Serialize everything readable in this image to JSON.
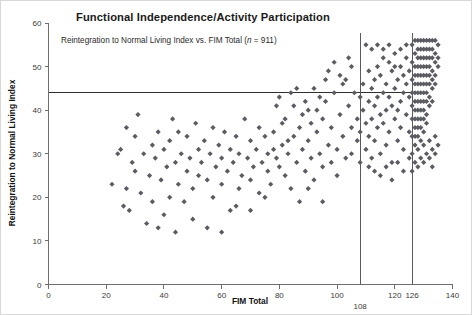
{
  "chart_data": {
    "type": "scatter",
    "title": "Functional Independence/Activity Participation",
    "subtitle_prefix": "Reintegration to Normal Living Index vs. FIM Total (",
    "subtitle_italic": "n",
    "subtitle_suffix": " = 911)",
    "xlabel": "FIM Total",
    "ylabel": "Reintegration to Normal Living Index",
    "xlim": [
      0,
      140
    ],
    "ylim": [
      0,
      60
    ],
    "xticks": [
      0,
      20,
      40,
      60,
      80,
      100,
      120,
      140
    ],
    "yticks": [
      0,
      10,
      20,
      30,
      40,
      50,
      60
    ],
    "grid": false,
    "legend": "none",
    "n": 911,
    "marker": "diamond",
    "marker_color": "#5b5b62",
    "marker_size": 4,
    "reference_lines": {
      "horizontal": [
        {
          "value": 44,
          "label": "",
          "axis": "y",
          "color": "#2e2e2e"
        }
      ],
      "vertical": [
        {
          "value": 108,
          "label": "108",
          "axis": "x",
          "color": "#5a5a5a"
        },
        {
          "value": 126,
          "label": "126",
          "axis": "x",
          "color": "#5a5a5a"
        }
      ]
    },
    "points": [
      [
        22,
        23
      ],
      [
        24,
        30
      ],
      [
        25,
        31
      ],
      [
        26,
        18
      ],
      [
        27,
        36
      ],
      [
        27,
        22
      ],
      [
        28,
        17
      ],
      [
        29,
        28
      ],
      [
        30,
        34
      ],
      [
        30,
        26
      ],
      [
        31,
        39
      ],
      [
        32,
        21
      ],
      [
        33,
        30
      ],
      [
        34,
        14
      ],
      [
        35,
        25
      ],
      [
        36,
        32
      ],
      [
        36,
        19
      ],
      [
        37,
        29
      ],
      [
        38,
        35
      ],
      [
        39,
        24
      ],
      [
        40,
        31
      ],
      [
        40,
        16
      ],
      [
        41,
        27
      ],
      [
        42,
        33
      ],
      [
        42,
        20
      ],
      [
        43,
        38
      ],
      [
        44,
        28
      ],
      [
        45,
        23
      ],
      [
        45,
        35
      ],
      [
        46,
        30
      ],
      [
        47,
        19
      ],
      [
        48,
        26
      ],
      [
        48,
        34
      ],
      [
        49,
        29
      ],
      [
        50,
        22
      ],
      [
        51,
        37
      ],
      [
        52,
        31
      ],
      [
        52,
        25
      ],
      [
        53,
        28
      ],
      [
        54,
        33
      ],
      [
        55,
        13
      ],
      [
        55,
        24
      ],
      [
        56,
        30
      ],
      [
        57,
        36
      ],
      [
        57,
        20
      ],
      [
        58,
        27
      ],
      [
        59,
        32
      ],
      [
        60,
        23
      ],
      [
        60,
        29
      ],
      [
        61,
        35
      ],
      [
        62,
        26
      ],
      [
        63,
        31
      ],
      [
        63,
        17
      ],
      [
        64,
        28
      ],
      [
        65,
        34
      ],
      [
        66,
        22
      ],
      [
        66,
        30
      ],
      [
        67,
        25
      ],
      [
        68,
        38
      ],
      [
        69,
        29
      ],
      [
        70,
        24
      ],
      [
        70,
        33
      ],
      [
        71,
        27
      ],
      [
        72,
        31
      ],
      [
        73,
        21
      ],
      [
        73,
        36
      ],
      [
        74,
        28
      ],
      [
        75,
        34
      ],
      [
        76,
        26
      ],
      [
        76,
        30
      ],
      [
        77,
        23
      ],
      [
        78,
        35
      ],
      [
        79,
        29
      ],
      [
        79,
        41
      ],
      [
        80,
        27
      ],
      [
        81,
        32
      ],
      [
        82,
        25
      ],
      [
        82,
        38
      ],
      [
        83,
        30
      ],
      [
        84,
        44
      ],
      [
        84,
        22
      ],
      [
        85,
        34
      ],
      [
        86,
        28
      ],
      [
        87,
        36
      ],
      [
        87,
        19
      ],
      [
        88,
        31
      ],
      [
        89,
        26
      ],
      [
        90,
        40
      ],
      [
        90,
        33
      ],
      [
        91,
        29
      ],
      [
        92,
        45
      ],
      [
        92,
        24
      ],
      [
        93,
        35
      ],
      [
        94,
        30
      ],
      [
        95,
        38
      ],
      [
        95,
        27
      ],
      [
        96,
        42
      ],
      [
        97,
        32
      ],
      [
        98,
        28
      ],
      [
        98,
        36
      ],
      [
        99,
        44
      ],
      [
        100,
        31
      ],
      [
        100,
        25
      ],
      [
        101,
        39
      ],
      [
        102,
        34
      ],
      [
        103,
        47
      ],
      [
        103,
        29
      ],
      [
        104,
        41
      ],
      [
        105,
        36
      ],
      [
        105,
        30
      ],
      [
        106,
        44
      ],
      [
        107,
        33
      ],
      [
        107,
        38
      ],
      [
        108,
        43
      ],
      [
        108,
        35
      ],
      [
        108,
        28
      ],
      [
        109,
        46
      ],
      [
        109,
        40
      ],
      [
        110,
        37
      ],
      [
        110,
        31
      ],
      [
        111,
        49
      ],
      [
        111,
        42
      ],
      [
        111,
        34
      ],
      [
        112,
        45
      ],
      [
        112,
        38
      ],
      [
        112,
        29
      ],
      [
        113,
        47
      ],
      [
        113,
        41
      ],
      [
        113,
        33
      ],
      [
        114,
        50
      ],
      [
        114,
        43
      ],
      [
        114,
        36
      ],
      [
        115,
        48
      ],
      [
        115,
        39
      ],
      [
        115,
        30
      ],
      [
        116,
        52
      ],
      [
        116,
        44
      ],
      [
        116,
        37
      ],
      [
        117,
        46
      ],
      [
        117,
        40
      ],
      [
        117,
        32
      ],
      [
        118,
        51
      ],
      [
        118,
        43
      ],
      [
        118,
        35
      ],
      [
        119,
        49
      ],
      [
        119,
        41
      ],
      [
        119,
        28
      ],
      [
        120,
        53
      ],
      [
        120,
        45
      ],
      [
        120,
        38
      ],
      [
        121,
        47
      ],
      [
        121,
        40
      ],
      [
        121,
        33
      ],
      [
        122,
        50
      ],
      [
        122,
        42
      ],
      [
        122,
        36
      ],
      [
        123,
        48
      ],
      [
        123,
        44
      ],
      [
        123,
        31
      ],
      [
        124,
        52
      ],
      [
        124,
        46
      ],
      [
        124,
        39
      ],
      [
        125,
        49
      ],
      [
        125,
        43
      ],
      [
        125,
        35
      ],
      [
        126,
        55
      ],
      [
        126,
        51
      ],
      [
        126,
        47
      ],
      [
        126,
        44
      ],
      [
        126,
        41
      ],
      [
        126,
        38
      ],
      [
        126,
        34
      ],
      [
        127,
        56
      ],
      [
        127,
        53
      ],
      [
        127,
        50
      ],
      [
        127,
        48
      ],
      [
        127,
        46
      ],
      [
        127,
        44
      ],
      [
        127,
        42
      ],
      [
        127,
        40
      ],
      [
        127,
        38
      ],
      [
        127,
        36
      ],
      [
        127,
        34
      ],
      [
        127,
        32
      ],
      [
        128,
        56
      ],
      [
        128,
        54
      ],
      [
        128,
        52
      ],
      [
        128,
        50
      ],
      [
        128,
        48
      ],
      [
        128,
        46
      ],
      [
        128,
        44
      ],
      [
        128,
        42
      ],
      [
        128,
        40
      ],
      [
        128,
        38
      ],
      [
        128,
        36
      ],
      [
        128,
        34
      ],
      [
        129,
        56
      ],
      [
        129,
        54
      ],
      [
        129,
        52
      ],
      [
        129,
        50
      ],
      [
        129,
        48
      ],
      [
        129,
        46
      ],
      [
        129,
        44
      ],
      [
        129,
        42
      ],
      [
        129,
        40
      ],
      [
        129,
        38
      ],
      [
        129,
        36
      ],
      [
        129,
        33
      ],
      [
        130,
        56
      ],
      [
        130,
        54
      ],
      [
        130,
        52
      ],
      [
        130,
        50
      ],
      [
        130,
        48
      ],
      [
        130,
        46
      ],
      [
        130,
        44
      ],
      [
        130,
        42
      ],
      [
        130,
        40
      ],
      [
        130,
        38
      ],
      [
        130,
        35
      ],
      [
        131,
        56
      ],
      [
        131,
        54
      ],
      [
        131,
        52
      ],
      [
        131,
        50
      ],
      [
        131,
        48
      ],
      [
        131,
        46
      ],
      [
        131,
        44
      ],
      [
        131,
        42
      ],
      [
        131,
        39
      ],
      [
        131,
        37
      ],
      [
        132,
        56
      ],
      [
        132,
        54
      ],
      [
        132,
        52
      ],
      [
        132,
        50
      ],
      [
        132,
        48
      ],
      [
        132,
        46
      ],
      [
        132,
        43
      ],
      [
        132,
        41
      ],
      [
        133,
        56
      ],
      [
        133,
        54
      ],
      [
        133,
        52
      ],
      [
        133,
        49
      ],
      [
        133,
        47
      ],
      [
        133,
        45
      ],
      [
        133,
        42
      ],
      [
        134,
        56
      ],
      [
        134,
        53
      ],
      [
        134,
        51
      ],
      [
        134,
        48
      ],
      [
        134,
        46
      ],
      [
        135,
        55
      ],
      [
        135,
        52
      ],
      [
        135,
        50
      ],
      [
        105,
        50
      ],
      [
        104,
        52
      ],
      [
        102,
        46
      ],
      [
        101,
        48
      ],
      [
        99,
        51
      ],
      [
        97,
        49
      ],
      [
        96,
        47
      ],
      [
        94,
        43
      ],
      [
        93,
        40
      ],
      [
        91,
        37
      ],
      [
        89,
        42
      ],
      [
        88,
        39
      ],
      [
        86,
        45
      ],
      [
        85,
        41
      ],
      [
        83,
        33
      ],
      [
        81,
        37
      ],
      [
        80,
        43
      ],
      [
        78,
        31
      ],
      [
        110,
        55
      ],
      [
        112,
        54
      ],
      [
        114,
        55
      ],
      [
        116,
        54
      ],
      [
        118,
        55
      ],
      [
        120,
        50
      ],
      [
        122,
        54
      ],
      [
        124,
        55
      ],
      [
        111,
        27
      ],
      [
        113,
        26
      ],
      [
        115,
        25
      ],
      [
        117,
        27
      ],
      [
        119,
        24
      ],
      [
        121,
        28
      ],
      [
        123,
        26
      ],
      [
        125,
        29
      ],
      [
        126,
        30
      ],
      [
        127,
        28
      ],
      [
        128,
        31
      ],
      [
        129,
        29
      ],
      [
        130,
        32
      ],
      [
        131,
        30
      ],
      [
        132,
        33
      ],
      [
        133,
        31
      ],
      [
        134,
        34
      ],
      [
        135,
        32
      ],
      [
        126,
        26
      ],
      [
        128,
        27
      ],
      [
        130,
        28
      ],
      [
        132,
        29
      ],
      [
        134,
        30
      ],
      [
        133,
        27
      ],
      [
        60,
        12
      ],
      [
        65,
        18
      ],
      [
        50,
        15
      ],
      [
        44,
        12
      ],
      [
        38,
        13
      ],
      [
        70,
        17
      ],
      [
        75,
        20
      ],
      [
        90,
        22
      ],
      [
        95,
        19
      ]
    ]
  }
}
